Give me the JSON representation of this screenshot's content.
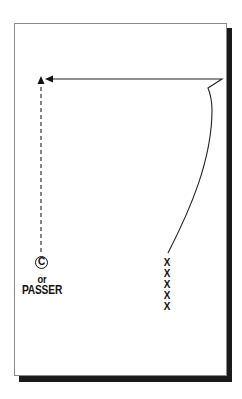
{
  "diagram": {
    "type": "football-play",
    "labels": {
      "center_symbol": "C",
      "or_text": "or",
      "passer_text": "PASSER"
    },
    "x_marks": [
      "X",
      "X",
      "X",
      "X",
      "X"
    ],
    "colors": {
      "ink": "#111111",
      "card_background": "#ffffff",
      "card_border": "#8a8a8a",
      "shadow": "#1a1a1a"
    },
    "paths": {
      "player_route": "curved run up from X line, cut left across top",
      "passer_route": "dashed vertical arrow upward"
    }
  }
}
